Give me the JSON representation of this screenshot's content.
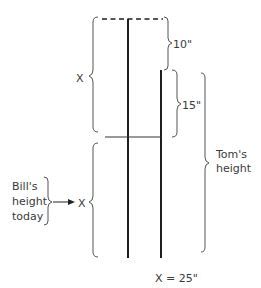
{
  "diagram": {
    "labels": {
      "top_x": "X",
      "bottom_x": "X",
      "ten_inches": "10\"",
      "fifteen_inches": "15\"",
      "toms_height_line1": "Tom's",
      "toms_height_line2": "height",
      "bills_line1": "Bill's",
      "bills_line2": "height",
      "bills_line3": "today",
      "solution": "X = 25\""
    },
    "colors": {
      "stroke": "#1e1e1e",
      "brace": "#555555",
      "text": "#3a3a3a"
    }
  }
}
